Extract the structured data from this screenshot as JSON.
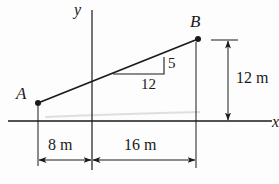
{
  "diagram": {
    "points": {
      "A": {
        "label": "A"
      },
      "B": {
        "label": "B"
      }
    },
    "axes": {
      "x_label": "x",
      "y_label": "y"
    },
    "slope": {
      "rise": "5",
      "run": "12"
    },
    "dimensions": {
      "height": "12 m",
      "left_width": "8 m",
      "right_width": "16 m"
    },
    "colors": {
      "ink": "#1a1a1a",
      "paper": "#fdfdfd",
      "smudge": "#cfd3d6"
    }
  }
}
